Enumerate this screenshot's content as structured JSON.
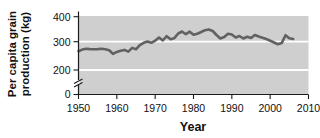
{
  "figure": {
    "ylabel_line1": "Per capita grain",
    "ylabel_line2": "production (kg)",
    "xlabel": "Year"
  },
  "chart_data": {
    "type": "line",
    "title": "",
    "xlabel": "Year",
    "ylabel": "Per capita grain production (kg)",
    "xlim": [
      1950,
      2010
    ],
    "ylim_main": [
      200,
      400
    ],
    "y_axis_break": true,
    "x_ticks": [
      1950,
      1960,
      1970,
      1980,
      1990,
      2000,
      2010
    ],
    "y_ticks": [
      0,
      200,
      300,
      400
    ],
    "grid_values": [
      200,
      300
    ],
    "legend": "none",
    "plot_bg": "#cfcfcf",
    "grid_color": "#ffffff",
    "line_color": "#616161",
    "axis_color": "#1a1a1a",
    "series": [
      {
        "name": "Per capita grain production (kg)",
        "x": [
          1950,
          1951,
          1952,
          1953,
          1954,
          1955,
          1956,
          1957,
          1958,
          1959,
          1960,
          1961,
          1962,
          1963,
          1964,
          1965,
          1966,
          1967,
          1968,
          1969,
          1970,
          1971,
          1972,
          1973,
          1974,
          1975,
          1976,
          1977,
          1978,
          1979,
          1980,
          1981,
          1982,
          1983,
          1984,
          1985,
          1986,
          1987,
          1988,
          1989,
          1990,
          1991,
          1992,
          1993,
          1994,
          1995,
          1996,
          1997,
          1998,
          1999,
          2000,
          2001,
          2002,
          2003,
          2004,
          2005,
          2006
        ],
        "values": [
          266,
          272,
          275,
          274,
          273,
          274,
          275,
          273,
          270,
          257,
          264,
          268,
          271,
          265,
          278,
          273,
          288,
          296,
          301,
          296,
          304,
          317,
          305,
          322,
          310,
          314,
          333,
          341,
          330,
          340,
          328,
          332,
          339,
          346,
          349,
          343,
          327,
          313,
          319,
          332,
          329,
          317,
          323,
          313,
          320,
          315,
          327,
          321,
          316,
          311,
          304,
          297,
          291,
          295,
          326,
          314,
          311
        ]
      }
    ]
  }
}
